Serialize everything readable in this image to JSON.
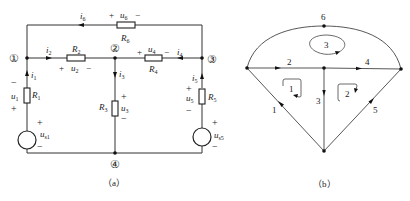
{
  "figure_a": {
    "caption": "（a）",
    "nodes": [
      {
        "id": "1",
        "label": "①"
      },
      {
        "id": "2",
        "label": "②"
      },
      {
        "id": "3",
        "label": "③"
      },
      {
        "id": "4",
        "label": "④"
      }
    ],
    "branches": {
      "R1": {
        "resistor": "R",
        "resistor_sub": "1",
        "voltage": "u",
        "voltage_sub": "1",
        "current": "i",
        "current_sub": "1",
        "plus": "+",
        "minus": "−",
        "source": "u",
        "source_sub": "s1"
      },
      "R2": {
        "resistor": "R",
        "resistor_sub": "2",
        "voltage": "u",
        "voltage_sub": "2",
        "current": "i",
        "current_sub": "2",
        "plus": "+",
        "minus": "−"
      },
      "R3": {
        "resistor": "R",
        "resistor_sub": "3",
        "voltage": "u",
        "voltage_sub": "3",
        "current": "i",
        "current_sub": "3",
        "plus": "+",
        "minus": "−"
      },
      "R4": {
        "resistor": "R",
        "resistor_sub": "4",
        "voltage": "u",
        "voltage_sub": "4",
        "current": "i",
        "current_sub": "4",
        "plus": "+",
        "minus": "−"
      },
      "R5": {
        "resistor": "R",
        "resistor_sub": "5",
        "voltage": "u",
        "voltage_sub": "5",
        "current": "i",
        "current_sub": "5",
        "plus": "+",
        "minus": "−",
        "source": "u",
        "source_sub": "s5"
      },
      "R6": {
        "resistor": "R",
        "resistor_sub": "6",
        "voltage": "u",
        "voltage_sub": "6",
        "current": "i",
        "current_sub": "6",
        "plus": "+",
        "minus": "−"
      }
    }
  },
  "figure_b": {
    "caption": "（b）",
    "edge_labels": [
      "1",
      "2",
      "3",
      "4",
      "5",
      "6"
    ],
    "loop_labels": [
      "1",
      "2",
      "3"
    ]
  }
}
